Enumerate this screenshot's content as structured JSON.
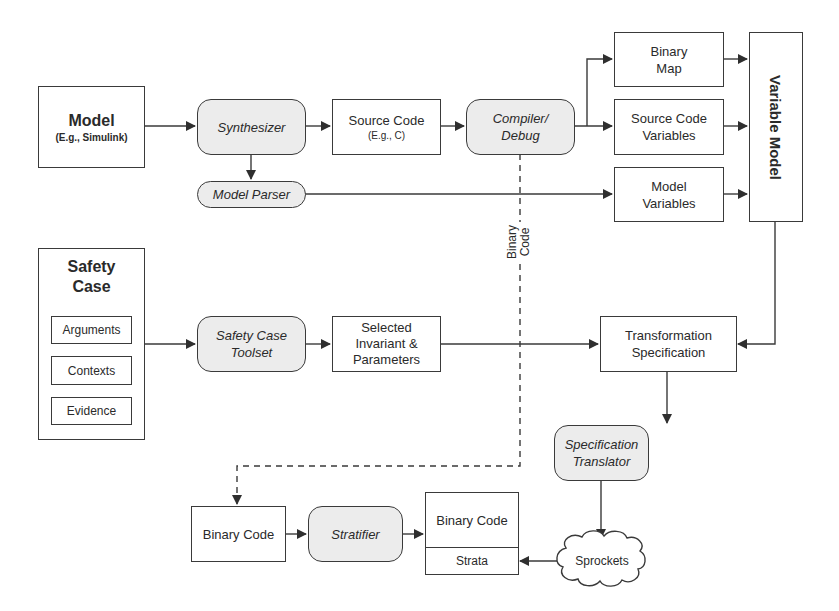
{
  "diagram": {
    "nodes": {
      "model": {
        "title": "Model",
        "subtitle": "(E.g., Simulink)"
      },
      "synthesizer": {
        "label": "Synthesizer"
      },
      "source_code": {
        "title": "Source Code",
        "subtitle": "(E.g., C)"
      },
      "compiler_debug": {
        "line1": "Compiler/",
        "line2": "Debug"
      },
      "binary_map": {
        "line1": "Binary",
        "line2": "Map"
      },
      "source_code_variables": {
        "line1": "Source Code",
        "line2": "Variables"
      },
      "model_variables": {
        "line1": "Model",
        "line2": "Variables"
      },
      "variable_model": {
        "label": "Variable Model"
      },
      "model_parser": {
        "label": "Model Parser"
      },
      "safety_case": {
        "line1": "Safety",
        "line2": "Case",
        "items": [
          "Arguments",
          "Contexts",
          "Evidence"
        ]
      },
      "safety_case_toolset": {
        "line1": "Safety Case",
        "line2": "Toolset"
      },
      "selected_invariant": {
        "line1": "Selected",
        "line2": "Invariant &",
        "line3": "Parameters"
      },
      "transformation_spec": {
        "line1": "Transformation",
        "line2": "Specification"
      },
      "spec_translator": {
        "line1": "Specification",
        "line2": "Translator"
      },
      "binary_code_input": {
        "label": "Binary Code"
      },
      "stratifier": {
        "label": "Stratifier"
      },
      "binary_code_output": {
        "top": "Binary Code",
        "bottom": "Strata"
      },
      "sprockets": {
        "label": "Sprockets"
      }
    },
    "edge_labels": {
      "binary_code_line1": "Binary",
      "binary_code_line2": "Code"
    },
    "colors": {
      "stroke": "#3a3a3a",
      "process_fill": "#ececec",
      "box_fill": "#ffffff"
    }
  }
}
